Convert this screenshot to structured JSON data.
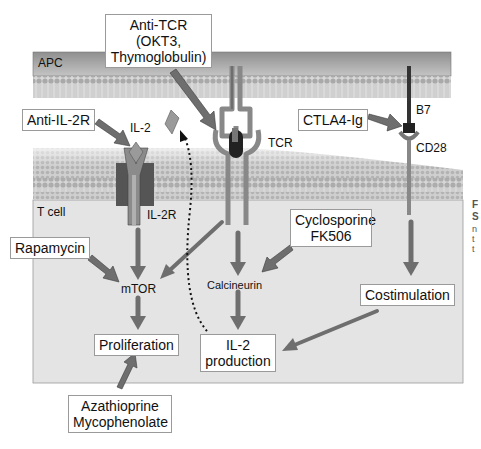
{
  "diagram": {
    "regions": {
      "apc_label": "APC",
      "tcell_label": "T cell"
    },
    "molecules": {
      "il2": "IL-2",
      "il2r": "IL-2R",
      "tcr": "TCR",
      "b7": "B7",
      "cd28": "CD28",
      "mtor": "mTOR",
      "calcineurin": "Calcineurin"
    },
    "drugs": {
      "anti_tcr_line1": "Anti-TCR",
      "anti_tcr_line2": "(OKT3,",
      "anti_tcr_line3": "Thymoglobulin)",
      "anti_il2r": "Anti-IL-2R",
      "ctla4ig": "CTLA4-Ig",
      "rapamycin": "Rapamycin",
      "cyclosporine_line1": "Cyclosporine",
      "cyclosporine_line2": "FK506",
      "azathioprine_line1": "Azathioprine",
      "azathioprine_line2": "Mycophenolate"
    },
    "outcomes": {
      "costimulation": "Costimulation",
      "proliferation": "Proliferation",
      "il2_production_line1": "IL-2",
      "il2_production_line2": "production"
    },
    "colors": {
      "membrane": "#b8b8b8",
      "apc_fill": "#9e9e9e",
      "tcell_fill": "#e6e6e6",
      "arrow": "#6e6e6e",
      "receptor_dark": "#4a4a4a",
      "receptor_mid": "#8a8a8a"
    }
  },
  "edge_text": {
    "line1": "F",
    "line2": "S",
    "line3": "n",
    "line4": "t",
    "line5": "t"
  }
}
